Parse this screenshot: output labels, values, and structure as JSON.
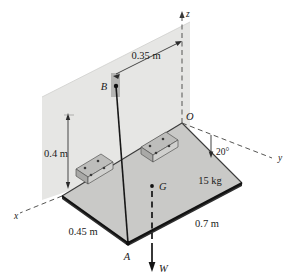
{
  "figure": {
    "page_marker": "",
    "axes": [
      {
        "name": "z-axis",
        "label": "z"
      },
      {
        "name": "y-axis",
        "label": "y"
      },
      {
        "name": "x-axis",
        "label": "x"
      }
    ],
    "points": [
      {
        "name": "point-o",
        "label": "O"
      },
      {
        "name": "point-a",
        "label": "A"
      },
      {
        "name": "point-b",
        "label": "B"
      },
      {
        "name": "point-g",
        "label": "G"
      }
    ],
    "dimensions": [
      {
        "name": "dim-035",
        "label": "0.35 m"
      },
      {
        "name": "dim-04",
        "label": "0.4 m"
      },
      {
        "name": "dim-045",
        "label": "0.45 m"
      },
      {
        "name": "dim-07",
        "label": "0.7 m"
      }
    ],
    "angle": {
      "name": "angle-20",
      "label": "20°"
    },
    "mass": {
      "name": "mass-label",
      "label": "15 kg"
    },
    "force": {
      "name": "weight-vector",
      "label": "W"
    },
    "colors": {
      "wall_fill": "#e4e4e2",
      "plate_fill": "#c9c9c7",
      "plate_edge": "#2a2a2a",
      "line": "#2b2b2b",
      "dashed": "#4a4a4a",
      "bracket_fill": "#b8b8b6",
      "background": "#ffffff"
    }
  }
}
